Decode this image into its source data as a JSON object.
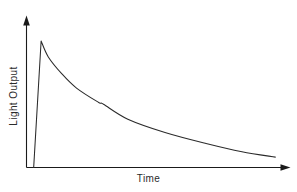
{
  "chart_data": {
    "type": "line",
    "title": "",
    "xlabel": "Time",
    "ylabel": "Light Output",
    "grid": false,
    "legend": false,
    "axes_style": "arrow-headed open axes, no tick marks, no tick labels",
    "xlim": [
      0,
      1
    ],
    "ylim": [
      0,
      1
    ],
    "series": [
      {
        "name": "Light Output",
        "color": "#2b2b2b",
        "x": [
          0.028,
          0.057,
          0.085,
          0.138,
          0.195,
          0.28,
          0.3,
          0.395,
          0.54,
          0.7,
          0.84,
          0.97
        ],
        "y": [
          0.0,
          1.0,
          0.874,
          0.74,
          0.628,
          0.516,
          0.5,
          0.382,
          0.277,
          0.19,
          0.125,
          0.082
        ]
      }
    ],
    "annotations": {
      "peak_label": "",
      "tail_label": ""
    }
  },
  "figure": {
    "background_color": "#ffffff",
    "line_color": "#2b2b2b",
    "axis_color": "#1a1a1a",
    "xlabel": "Time",
    "ylabel": "Light Output"
  }
}
